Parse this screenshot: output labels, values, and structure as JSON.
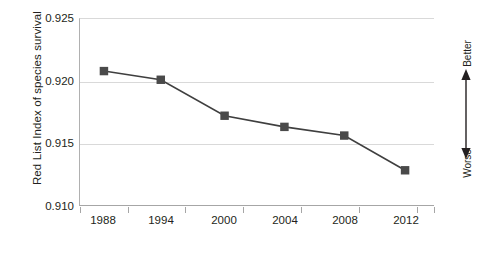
{
  "chart_data": {
    "type": "line",
    "title": "",
    "xlabel": "",
    "ylabel": "Red List Index of species survival",
    "x": [
      1988,
      1994,
      2000,
      2004,
      2008,
      2012
    ],
    "categories": [
      "1988",
      "1994",
      "2000",
      "2004",
      "2008",
      "2012"
    ],
    "values": [
      0.9208,
      0.9201,
      0.9172,
      0.9163,
      0.9156,
      0.9128
    ],
    "series": [
      {
        "name": "Red List Index of species survival",
        "values": [
          0.9208,
          0.9201,
          0.9172,
          0.9163,
          0.9156,
          0.9128
        ]
      }
    ],
    "ylim": [
      0.91,
      0.925
    ],
    "yticks": [
      "0.910",
      "0.915",
      "0.920",
      "0.925"
    ],
    "ytick_values": [
      0.91,
      0.915,
      0.92,
      0.925
    ],
    "xtick_labels": [
      "1988",
      "1994",
      "2000",
      "2004",
      "2008",
      "2012"
    ],
    "grid": "horizontal",
    "legend": "none",
    "marker": "square",
    "line_color": "#3f3f3f",
    "marker_color": "#4a4a4a",
    "grid_color": "#d9d9d9",
    "axis_color": "#a6a6a6"
  },
  "annotation": {
    "better_label": "Better",
    "worse_label": "Worse",
    "arrow": "double-headed-vertical-arrow"
  }
}
